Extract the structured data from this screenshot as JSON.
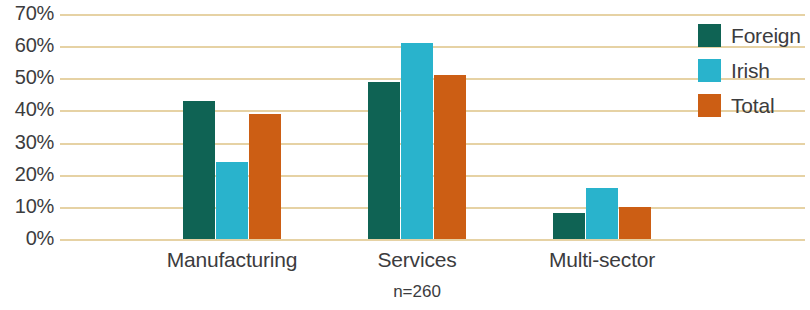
{
  "chart_data": {
    "type": "bar",
    "title": "",
    "subtitle": "",
    "xlabel": "",
    "ylabel": "",
    "note": "n=260",
    "categories": [
      "Manufacturing",
      "Services",
      "Multi-sector"
    ],
    "series": [
      {
        "name": "Foreign",
        "color": "#0f6354",
        "values": [
          43,
          49,
          8
        ]
      },
      {
        "name": "Irish",
        "color": "#29b3cc",
        "values": [
          24,
          61,
          16
        ]
      },
      {
        "name": "Total",
        "color": "#cc5e14",
        "values": [
          39,
          51,
          10
        ]
      }
    ],
    "ylim": [
      0,
      70
    ],
    "ytick_step": 10,
    "ytick_labels": [
      "70%",
      "60%",
      "50%",
      "40%",
      "30%",
      "20%",
      "10%",
      "0%"
    ],
    "ytick_values": [
      70,
      60,
      50,
      40,
      30,
      20,
      10,
      0
    ],
    "grid": true,
    "grid_color": "#e6d2a4",
    "legend_position": "right",
    "background_color": "#ffffff",
    "text_color": "#3c3c3e"
  }
}
